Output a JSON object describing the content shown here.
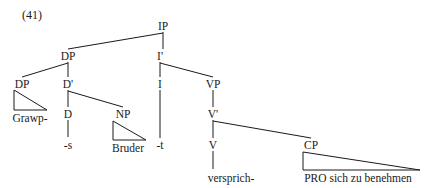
{
  "figure": {
    "example_number": "(41)",
    "type": "syntax-tree",
    "language": "German",
    "sentence": "Grawp-s Bruder versprich-t PRO sich zu benehmen"
  },
  "tree": {
    "nodes": [
      {
        "id": "IP",
        "label": "IP",
        "x": 163,
        "y": 27
      },
      {
        "id": "DP-spec",
        "label": "DP",
        "x": 68,
        "y": 57
      },
      {
        "id": "Ibar",
        "label": "I'",
        "x": 160,
        "y": 57
      },
      {
        "id": "DP-poss",
        "label": "DP",
        "x": 22,
        "y": 85
      },
      {
        "id": "Dbar",
        "label": "D'",
        "x": 68,
        "y": 85
      },
      {
        "id": "I",
        "label": "I",
        "x": 160,
        "y": 85
      },
      {
        "id": "VP",
        "label": "VP",
        "x": 213,
        "y": 85
      },
      {
        "id": "D",
        "label": "D",
        "x": 68,
        "y": 115
      },
      {
        "id": "NP",
        "label": "NP",
        "x": 123,
        "y": 115
      },
      {
        "id": "Vbar",
        "label": "V'",
        "x": 213,
        "y": 115
      },
      {
        "id": "V",
        "label": "V",
        "x": 213,
        "y": 146
      },
      {
        "id": "CP",
        "label": "CP",
        "x": 311,
        "y": 146
      }
    ],
    "terminals": [
      {
        "id": "t-grawp",
        "label": "Grawp-",
        "x": 30,
        "y": 119
      },
      {
        "id": "t-s",
        "label": "-s",
        "x": 68,
        "y": 146
      },
      {
        "id": "t-bruder",
        "label": "Bruder",
        "x": 128,
        "y": 149
      },
      {
        "id": "t-t",
        "label": "-t",
        "x": 160,
        "y": 146
      },
      {
        "id": "t-versp",
        "label": "versprich-",
        "x": 231,
        "y": 180
      },
      {
        "id": "t-pro",
        "label": "PRO sich zu benehmen",
        "x": 358,
        "y": 180
      }
    ]
  }
}
